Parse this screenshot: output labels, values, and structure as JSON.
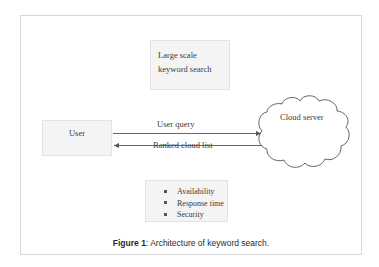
{
  "figure": {
    "caption_prefix": "Figure 1",
    "caption_separator": ": ",
    "caption_text": "Architecture of keyword search."
  },
  "diagram": {
    "nodes": {
      "large_scale_box": {
        "line1": "Large scale",
        "line2": "keyword search"
      },
      "user_box": {
        "label": "User"
      },
      "cloud_server": {
        "label": "Cloud server"
      },
      "qos_box": {
        "items": [
          "Availability",
          "Response time",
          "Security"
        ]
      }
    },
    "edges": {
      "user_query": "User query",
      "ranked_cloud_list": "Ranked cloud list"
    }
  },
  "colors": {
    "box_fill": "#f4f4f4",
    "box_border": "#e3e3e3",
    "frame_border": "#d8d8d8",
    "stroke": "#555555",
    "text": "#3a3a3a",
    "caption_text": "#2b2b2b",
    "background": "#ffffff"
  }
}
